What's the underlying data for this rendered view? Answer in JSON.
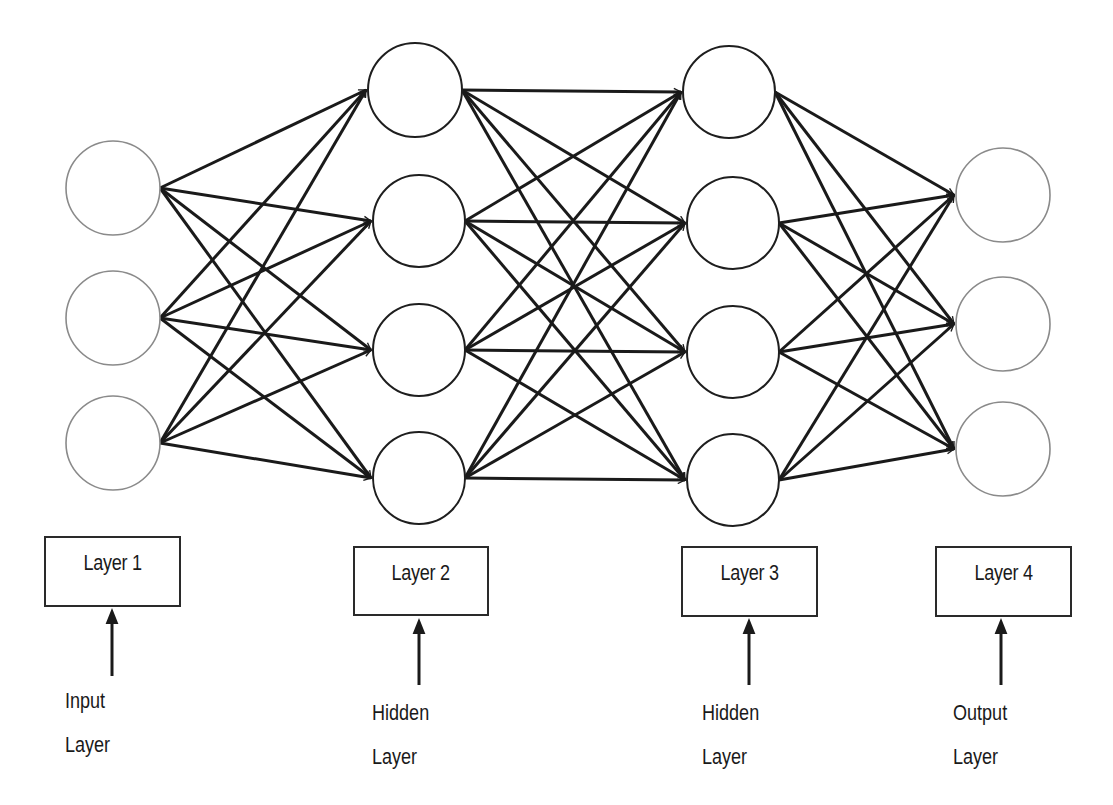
{
  "diagram": {
    "type": "feedforward-neural-network",
    "layers": [
      {
        "id": "layer1",
        "box_label": "Layer 1",
        "role_line1": "Input",
        "role_line2": "Layer",
        "node_count": 3,
        "kind": "input"
      },
      {
        "id": "layer2",
        "box_label": "Layer 2",
        "role_line1": "Hidden",
        "role_line2": "Layer",
        "node_count": 4,
        "kind": "hidden"
      },
      {
        "id": "layer3",
        "box_label": "Layer 3",
        "role_line1": "Hidden",
        "role_line2": "Layer",
        "node_count": 4,
        "kind": "hidden"
      },
      {
        "id": "layer4",
        "box_label": "Layer 4",
        "role_line1": "Output",
        "role_line2": "Layer",
        "node_count": 3,
        "kind": "output"
      }
    ],
    "connections": "fully-connected between adjacent layers, directed left to right",
    "colors": {
      "edge": "#1a1a1a",
      "input_output_node_stroke": "#8a8a8a",
      "hidden_node_stroke": "#1e1e1e",
      "background": "#ffffff"
    }
  }
}
